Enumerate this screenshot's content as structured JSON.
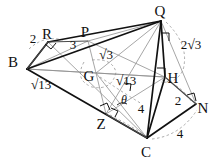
{
  "figure": {
    "type": "geometry-diagram",
    "background_color": "#ffffff",
    "stroke_color": "#111111",
    "dashed_color": "#999999",
    "width": 218,
    "height": 166,
    "vertices": [
      {
        "name": "B",
        "label": "B",
        "x": 13,
        "y": 62,
        "point_x": 27,
        "point_y": 69
      },
      {
        "name": "R",
        "label": "R",
        "x": 47,
        "y": 34,
        "point_x": 48,
        "point_y": 42
      },
      {
        "name": "P",
        "label": "P",
        "x": 85,
        "y": 32,
        "point_x": 88,
        "point_y": 41
      },
      {
        "name": "Q",
        "label": "Q",
        "x": 160,
        "y": 11,
        "point_x": 161,
        "point_y": 21
      },
      {
        "name": "G",
        "label": "G",
        "x": 89,
        "y": 76,
        "point_x": 96,
        "point_y": 73
      },
      {
        "name": "H",
        "label": "H",
        "x": 173,
        "y": 78,
        "point_x": 165,
        "point_y": 77
      },
      {
        "name": "N",
        "label": "N",
        "x": 203,
        "y": 108,
        "point_x": 196,
        "point_y": 104
      },
      {
        "name": "Z",
        "label": "Z",
        "x": 101,
        "y": 124,
        "point_x": 106,
        "point_y": 114
      },
      {
        "name": "C",
        "label": "C",
        "x": 146,
        "y": 152,
        "point_x": 147,
        "point_y": 138
      }
    ],
    "measurements": [
      {
        "name": "BR-length",
        "text": "2",
        "x": 33,
        "y": 38,
        "kind": "integer"
      },
      {
        "name": "RP-length",
        "text": "3",
        "x": 73,
        "y": 44,
        "kind": "integer"
      },
      {
        "name": "PG-length",
        "text": "3",
        "x": 106,
        "y": 55,
        "kind": "radical",
        "radicand": "3"
      },
      {
        "name": "QH-length",
        "text": "2 3",
        "x": 191,
        "y": 45,
        "kind": "coeff-radical",
        "coefficient": "2",
        "radicand": "3"
      },
      {
        "name": "BC-length",
        "text": "13",
        "x": 41,
        "y": 85,
        "kind": "radical",
        "radicand": "13"
      },
      {
        "name": "GC-length",
        "text": "13",
        "x": 126,
        "y": 81,
        "kind": "radical",
        "radicand": "13"
      },
      {
        "name": "angle-theta",
        "text": "θ",
        "x": 124,
        "y": 100,
        "kind": "angle"
      },
      {
        "name": "ZC-length",
        "text": "4",
        "x": 141,
        "y": 108,
        "kind": "integer"
      },
      {
        "name": "HN-length",
        "text": "2",
        "x": 178,
        "y": 100,
        "kind": "integer"
      },
      {
        "name": "CN-length",
        "text": "4",
        "x": 180,
        "y": 133,
        "kind": "integer"
      }
    ],
    "right_angle_marks": [
      {
        "name": "right-angle-at-R",
        "x": 51,
        "y": 47
      },
      {
        "name": "right-angle-at-Q",
        "x": 166,
        "y": 37
      },
      {
        "name": "right-angle-at-H",
        "x": 161,
        "y": 71
      },
      {
        "name": "right-angle-at-N",
        "x": 192,
        "y": 98
      },
      {
        "name": "right-angle-at-Z1",
        "x": 104,
        "y": 110
      },
      {
        "name": "right-angle-at-Z2",
        "x": 115,
        "y": 112
      },
      {
        "name": "right-angle-at-G",
        "x": 129,
        "y": 88
      }
    ],
    "arcs": [
      {
        "name": "arc-B-R",
        "note": "dashed arc near B and R"
      },
      {
        "name": "arc-G",
        "note": "dashed arc around G"
      },
      {
        "name": "arc-Q-H",
        "note": "dashed arc right of Q down to H"
      },
      {
        "name": "arc-H-N",
        "note": "dashed arc from H toward N"
      },
      {
        "name": "arc-C-N",
        "note": "dashed arc from C toward N"
      },
      {
        "name": "arc-Z-C",
        "note": "dashed arc from Z toward C"
      }
    ]
  }
}
